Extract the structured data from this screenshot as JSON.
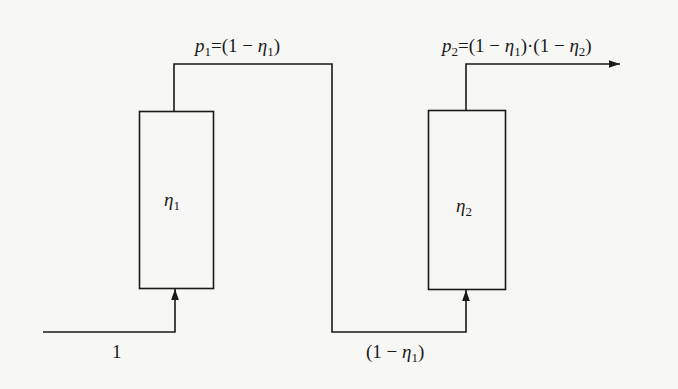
{
  "diagram": {
    "type": "two-stage series separation flow",
    "colors": {
      "line": "#1a1a1a",
      "background": "#f7f7f5"
    },
    "stages": [
      {
        "id": "stage-1",
        "label_symbol": "η",
        "label_index": "1"
      },
      {
        "id": "stage-2",
        "label_symbol": "η",
        "label_index": "2"
      }
    ],
    "labels": {
      "input": "1",
      "p1": {
        "var": "p",
        "index": "1",
        "expr_prefix": "=(1 − ",
        "eta": "η",
        "eta_index": "1",
        "expr_suffix": ")"
      },
      "between": {
        "prefix": "(1 − ",
        "eta": "η",
        "eta_index": "1",
        "suffix": ")"
      },
      "p2": {
        "var": "p",
        "index": "2",
        "part1_prefix": "=(1 − ",
        "part1_eta": "η",
        "part1_index": "1",
        "part1_suffix": ")·",
        "part2_prefix": "(1 − ",
        "part2_eta": "η",
        "part2_index": "2",
        "part2_suffix": ")"
      }
    }
  }
}
